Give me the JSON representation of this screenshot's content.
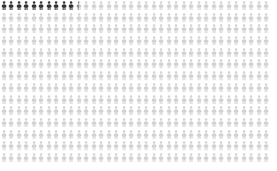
{
  "chart_data": {
    "type": "pictogram",
    "title": "",
    "subtitle": "",
    "xlabel": "",
    "ylabel": "",
    "legend": [],
    "annotations": [],
    "grid": false,
    "icon": "person-icon",
    "icon_unit_value": 1,
    "columns": 36,
    "rows": 14,
    "total_icons": 504,
    "highlighted_count": 10,
    "partial_index": 10,
    "partial_fraction": 0.5,
    "remaining_count": 493,
    "categories": [
      "highlighted",
      "partial",
      "remaining"
    ],
    "values": [
      10,
      1,
      493
    ],
    "colors": {
      "background": "#ffffff",
      "highlight": "#333333",
      "partial": "#8a8a8a",
      "remaining": "#d2d2d2"
    },
    "layout": {
      "cell_width": 7.5,
      "cell_height": 11.7,
      "icon_width": 6.2,
      "icon_height": 9.4,
      "offset_x": 0,
      "offset_y": 1
    }
  }
}
